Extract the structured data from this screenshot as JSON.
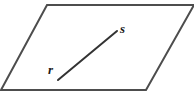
{
  "diagram": {
    "type": "geometry-plane-with-segment",
    "background_color": "#ffffff",
    "stroke_color": "#4d4d4d",
    "segment_color": "#333333",
    "label_color": "#1a1a1a",
    "plane": {
      "name": "parallelogram",
      "stroke_width": 2,
      "fill": "none",
      "points": "47,5 194,5 146,90 1,90",
      "vertices": [
        {
          "name": "top-left",
          "x": 47,
          "y": 5
        },
        {
          "name": "top-right",
          "x": 194,
          "y": 5
        },
        {
          "name": "bottom-right",
          "x": 146,
          "y": 90
        },
        {
          "name": "bottom-left",
          "x": 1,
          "y": 90
        }
      ]
    },
    "segment": {
      "name": "segment-rs",
      "stroke_width": 2,
      "x1": 58,
      "y1": 80,
      "x2": 117,
      "y2": 31
    },
    "labels": [
      {
        "id": "s",
        "text": "s",
        "x": 120,
        "y": 22
      },
      {
        "id": "r",
        "text": "r",
        "x": 48,
        "y": 63
      }
    ]
  }
}
